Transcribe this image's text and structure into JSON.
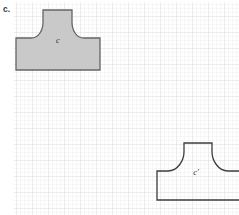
{
  "figure": {
    "part_label": "c.",
    "background_color": "#ffffff",
    "grid": {
      "minor_spacing_px": 4,
      "major_spacing_px": 16,
      "minor_color": "#f0eff2",
      "major_color": "#e0dee4",
      "left_px": 14,
      "top_px": 2,
      "right_px": 239,
      "bottom_px": 215
    },
    "shapes": [
      {
        "id": "shape-original",
        "label": "c",
        "label_x": 58,
        "label_y": 43,
        "filled": true,
        "fill_color": "#c9c9c9",
        "stroke_color": "#666666",
        "stroke_width": 1.3,
        "clipped": false,
        "path": "M 16 38 L 16 70 L 100 70 L 100 38 L 84 38 C 76 38 72 30 72 22 L 72 10 L 43 10 L 43 22 C 43 30 39 38 31 38 Z"
      },
      {
        "id": "shape-image",
        "label": "c'",
        "label_x": 196,
        "label_y": 175,
        "filled": false,
        "fill_color": "none",
        "stroke_color": "#3d3d3d",
        "stroke_width": 1.3,
        "clipped": true,
        "path": "M 157 171 L 157 200 L 248 200 L 248 171 L 228 171 C 218 171 212 160 212 152 L 212 143 L 184 143 L 184 152 C 184 160 178 171 168 171 Z"
      }
    ]
  }
}
